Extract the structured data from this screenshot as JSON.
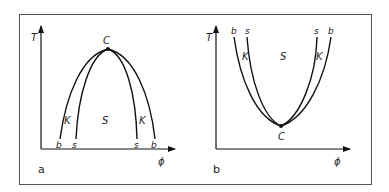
{
  "figure": {
    "frame_color": "#555555",
    "line_color": "#111111",
    "panels": [
      {
        "id": "a",
        "label": "a",
        "y_axis_label": "T",
        "x_axis_label": "ϕ",
        "critical_point_label": "C",
        "region_labels": {
          "inner": "S",
          "left_between": "K",
          "right_between": "K"
        },
        "curve_end_labels": {
          "binodal_left": "b",
          "spinodal_left": "s",
          "spinodal_right": "s",
          "binodal_right": "b"
        },
        "shape": "upper critical point (dome)"
      },
      {
        "id": "b",
        "label": "b",
        "y_axis_label": "T",
        "x_axis_label": "ϕ",
        "critical_point_label": "C",
        "region_labels": {
          "inner": "S",
          "left_between": "K",
          "right_between": "K"
        },
        "curve_end_labels": {
          "binodal_left": "b",
          "spinodal_left": "s",
          "spinodal_right": "s",
          "binodal_right": "b"
        },
        "shape": "lower critical point (bowl)"
      }
    ]
  }
}
